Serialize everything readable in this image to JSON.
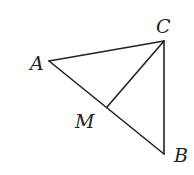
{
  "figure": {
    "type": "geometry-triangle",
    "points": {
      "A": {
        "label": "A",
        "x": 49,
        "y": 61,
        "label_x": 30,
        "label_y": 70
      },
      "B": {
        "label": "B",
        "x": 164,
        "y": 154,
        "label_x": 174,
        "label_y": 162
      },
      "C": {
        "label": "C",
        "x": 164,
        "y": 41,
        "label_x": 156,
        "label_y": 33
      },
      "M": {
        "label": "M",
        "x": 107,
        "y": 107,
        "label_x": 75,
        "label_y": 128
      }
    },
    "segments": [
      {
        "from": "A",
        "to": "C"
      },
      {
        "from": "A",
        "to": "B"
      },
      {
        "from": "C",
        "to": "B"
      },
      {
        "from": "C",
        "to": "M"
      }
    ],
    "stroke_color": "#222222"
  }
}
